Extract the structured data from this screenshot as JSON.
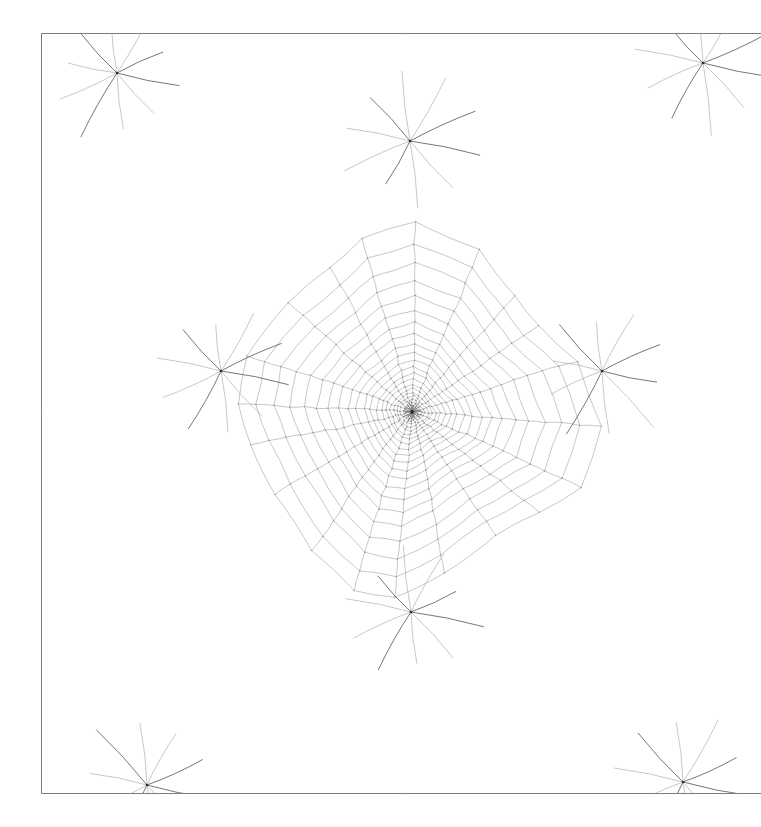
{
  "figure": {
    "name": "quad-mesh-singularity-field",
    "title": "",
    "background_color": "#ffffff",
    "width": 761,
    "height": 827
  },
  "chart_data": {
    "type": "mesh",
    "title": "",
    "subtitle": "",
    "xlabel": "",
    "ylabel": "",
    "grid": false,
    "legend": null,
    "annotations": [],
    "render": {
      "line_color": "#9a9a9a",
      "line_color_dark": "#5a5a5a",
      "line_width": 0.55,
      "boundary_color": "#6d6d6d",
      "boundary_width": 0.9,
      "node_color": "#8a8a8a",
      "node_radius": 0.55,
      "singularity_color": "#2a2a2a",
      "antialias": true
    },
    "domain": {
      "x_min": 41,
      "y_min": 33,
      "x_max": 761,
      "y_max": 793,
      "clip_right": true,
      "note_visible_border": [
        "left",
        "top",
        "bottom"
      ]
    },
    "center_singularity": {
      "x": 412,
      "y": 412,
      "valence": 20
    },
    "ring_singularities": [
      {
        "x": 221,
        "y": 371,
        "valence": 8
      },
      {
        "x": 602,
        "y": 371,
        "valence": 8
      },
      {
        "x": 410,
        "y": 141,
        "valence": 8
      },
      {
        "x": 411,
        "y": 612,
        "valence": 8
      },
      {
        "x": 117,
        "y": 73,
        "valence": 8
      },
      {
        "x": 703,
        "y": 63,
        "valence": 8
      },
      {
        "x": 147,
        "y": 785,
        "valence": 8
      },
      {
        "x": 683,
        "y": 782,
        "valence": 8
      }
    ],
    "field": {
      "description": "radial-azimuthal quad field around a high-valence center",
      "radial_lines": 20,
      "rings": 22,
      "wave_amplitude": 0.055,
      "wave_frequency": 5,
      "jitter": 0.9,
      "ring_growth": 1.118
    },
    "axis_ranges": {
      "xlim": [
        41,
        761
      ],
      "ylim": [
        33,
        793
      ]
    }
  }
}
